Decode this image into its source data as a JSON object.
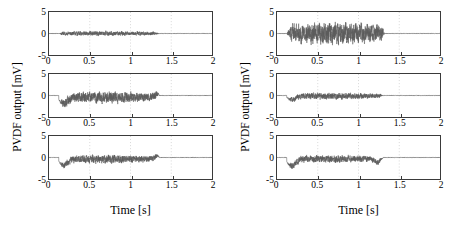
{
  "figure": {
    "background": "#ffffff",
    "trace_color": "#5a5a5a",
    "axis_color": "#3a3a3a",
    "grid_color": "#b9b9b9"
  },
  "axis": {
    "xlabel": "Time [s]",
    "ylabel": "PVDF output [mV]",
    "xticks": [
      "0",
      "0.5",
      "1",
      "1.5",
      "2"
    ],
    "yticks": [
      "5",
      "0",
      "-5"
    ],
    "xlim": [
      0,
      2
    ],
    "ylim": [
      -5,
      5
    ],
    "gridlines_x": [
      0.5,
      1,
      1.5
    ]
  },
  "chart_data": {
    "type": "line",
    "title": "",
    "xlabel": "Time [s]",
    "ylabel": "PVDF output [mV]",
    "xlim": [
      0,
      2
    ],
    "ylim": [
      -5,
      5
    ],
    "xticks": [
      0,
      0.5,
      1,
      1.5,
      2
    ],
    "yticks": [
      -5,
      0,
      5
    ],
    "grid": "vertical dotted at 0.5, 1, 1.5",
    "legend": "none",
    "panels": [
      {
        "id": "left-top",
        "group": "left",
        "row": 0,
        "burst_start_s": 0.12,
        "burst_end_s": 1.35,
        "baseline_mV": 0,
        "peak_amplitude_mV": 0.55,
        "mean_offset_mV": 0,
        "initial_dip_mV": 0,
        "description": "low-amplitude band-limited noise burst, symmetric about zero, flat baseline outside burst"
      },
      {
        "id": "left-middle",
        "group": "left",
        "row": 1,
        "burst_start_s": 0.12,
        "burst_end_s": 1.35,
        "baseline_mV": 0,
        "peak_amplitude_mV": 1.3,
        "mean_offset_mV": -0.45,
        "initial_dip_mV": -1.6,
        "description": "sharp negative dip at onset then sustained oscillation with negative bias, recovers to zero at 1.35 s"
      },
      {
        "id": "left-bottom",
        "group": "left",
        "row": 2,
        "burst_start_s": 0.12,
        "burst_end_s": 1.35,
        "baseline_mV": 0,
        "peak_amplitude_mV": 0.95,
        "mean_offset_mV": -0.4,
        "initial_dip_mV": -1.5,
        "description": "negative dip at onset then moderate noise with slight negative bias, small positive step at end of burst"
      },
      {
        "id": "right-top",
        "group": "right",
        "row": 0,
        "burst_start_s": 0.12,
        "burst_end_s": 1.32,
        "baseline_mV": 0,
        "peak_amplitude_mV": 2.6,
        "mean_offset_mV": 0.1,
        "initial_dip_mV": 0,
        "description": "large amplitude dense oscillation filling most of the vertical range, abrupt stop at 1.32 s"
      },
      {
        "id": "right-middle",
        "group": "right",
        "row": 1,
        "burst_start_s": 0.12,
        "burst_end_s": 1.3,
        "baseline_mV": 0,
        "peak_amplitude_mV": 0.75,
        "mean_offset_mV": -0.15,
        "initial_dip_mV": -0.8,
        "description": "moderate low-amplitude noise with slight negative bias, quiet after 1.3 s"
      },
      {
        "id": "right-bottom",
        "group": "right",
        "row": 2,
        "burst_start_s": 0.12,
        "burst_end_s": 1.3,
        "baseline_mV": 0,
        "peak_amplitude_mV": 0.85,
        "mean_offset_mV": -0.35,
        "initial_dip_mV": -1.7,
        "description": "deep negative dip at onset then noise with negative bias, secondary dip near 1.25 s, flat after"
      }
    ]
  }
}
